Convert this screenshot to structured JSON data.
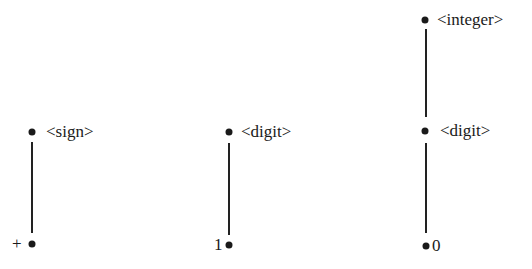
{
  "diagram": {
    "type": "parse-trees",
    "trees": [
      {
        "nodes": [
          {
            "label": "<sign>",
            "x": 32,
            "y": 132,
            "lx": 48
          },
          {
            "label": "+",
            "x": 32,
            "y": 244,
            "lx": 13
          }
        ],
        "edges": [
          {
            "x": 32,
            "y1": 142,
            "y2": 233
          }
        ]
      },
      {
        "nodes": [
          {
            "label": "<digit>",
            "x": 229,
            "y": 132,
            "lx": 242
          },
          {
            "label": "1",
            "x": 229,
            "y": 245,
            "lx": 215
          }
        ],
        "edges": [
          {
            "x": 229,
            "y1": 143,
            "y2": 235
          }
        ]
      },
      {
        "nodes": [
          {
            "label": "<integer>",
            "x": 425,
            "y": 20,
            "lx": 438
          },
          {
            "label": "<digit>",
            "x": 425,
            "y": 131,
            "lx": 441
          },
          {
            "label": "0",
            "x": 426,
            "y": 246,
            "lx": 433
          }
        ],
        "edges": [
          {
            "x": 426,
            "y1": 29,
            "y2": 117
          },
          {
            "x": 426,
            "y1": 143,
            "y2": 233
          }
        ]
      }
    ]
  }
}
